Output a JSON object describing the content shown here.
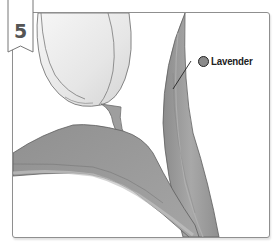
{
  "step": {
    "number": "5"
  },
  "callouts": [
    {
      "label": "Lavender",
      "swatch_color": "#8a8a8a"
    }
  ],
  "illustration": {
    "subject": "tulip coloring step",
    "colors": {
      "petal": "#ececec",
      "petal_shade": "#d8d8d8",
      "outline": "#6a6a6a",
      "stem": "#9a9a9a",
      "leaf": "#9c9c9c",
      "leaf_dark": "#8a8a8a",
      "leaf_light": "#bdbdbd"
    }
  }
}
